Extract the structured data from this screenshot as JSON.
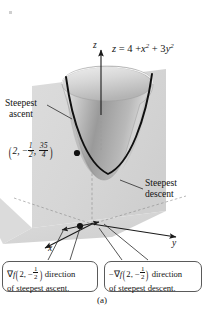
{
  "figure": {
    "part_label": "(a)",
    "equation": {
      "lhs": "z",
      "eq": "=",
      "rhs_a": "4 +",
      "rhs_x": "x",
      "rhs_x_exp": "2",
      "rhs_plus": "+ 3",
      "rhs_y": "y",
      "rhs_y_exp": "2",
      "full": "z = 4 + x² + 3y²"
    },
    "axes": {
      "z_label": "z",
      "x_label": "x",
      "y_label": "y"
    },
    "callouts": {
      "ascent_line1": "Steepest",
      "ascent_line2": "ascent",
      "descent_line1": "Steepest",
      "descent_line2": "descent"
    },
    "point_label": {
      "open": "(",
      "x": "2,",
      "y_sign": "−",
      "y_num": "1",
      "y_den": "2",
      "comma": ",",
      "z_num": "35",
      "z_den": "4",
      "close": ")",
      "full": "(2, -1/2, 35/4)"
    },
    "caption_left": {
      "grad": "∇",
      "f": "f",
      "open": "(",
      "arg_x": "2,",
      "arg_y_sign": "−",
      "arg_y_num": "1",
      "arg_y_den": "2",
      "close": ")",
      "tail": "direction",
      "line2": "of steepest ascent.",
      "full": "∇f(2, −1/2) direction of steepest ascent."
    },
    "caption_right": {
      "minus": "−",
      "grad": "∇",
      "f": "f",
      "open": "(",
      "arg_x": "2,",
      "arg_y_sign": "−",
      "arg_y_num": "1",
      "arg_y_den": "2",
      "close": ")",
      "tail": "direction",
      "line2": "of steepest descent.",
      "full": "−∇f(2, −1/2) direction of steepest descent."
    },
    "colors": {
      "plane_fill": "#d9d9d9",
      "surface_light": "#e6e6e6",
      "surface_dark": "#8e8e8e",
      "curve": "#101010",
      "axis": "#1a1a1a",
      "box_border": "#5a5a5a",
      "background": "#ffffff"
    }
  }
}
